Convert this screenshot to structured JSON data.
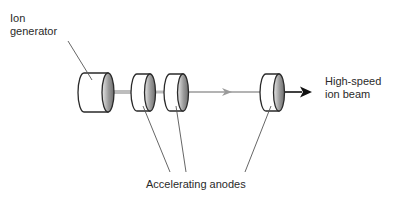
{
  "diagram": {
    "labels": {
      "ion_generator_line1": "Ion",
      "ion_generator_line2": "generator",
      "beam_line1": "High-speed",
      "beam_line2": "ion beam",
      "anodes": "Accelerating anodes"
    },
    "components": [
      {
        "id": "ion-generator",
        "type": "cylinder",
        "x": 78,
        "y": 73,
        "w": 36,
        "h": 39
      },
      {
        "id": "anode-1",
        "type": "cylinder",
        "x": 131,
        "y": 74,
        "w": 24,
        "h": 37
      },
      {
        "id": "anode-2",
        "type": "cylinder",
        "x": 164,
        "y": 74,
        "w": 24,
        "h": 37
      },
      {
        "id": "anode-3",
        "type": "cylinder",
        "x": 260,
        "y": 74,
        "w": 24,
        "h": 37
      }
    ],
    "colors": {
      "outline": "#2a2a2a",
      "beam_light": "#9a9a9a",
      "beam_dark": "#111111",
      "face_dark": "#8a8a8a",
      "face_light": "#e6e6e6"
    }
  }
}
